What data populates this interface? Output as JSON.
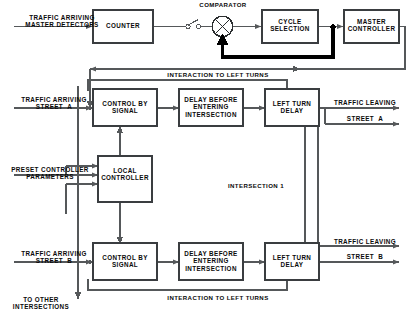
{
  "diagram": {
    "region_label": "INTERSECTION 1",
    "colors": {
      "line": "#55585a",
      "thick_line": "#000000",
      "box_border": "#3a3d40",
      "text": "#0a0a0a",
      "background": "#ffffff"
    },
    "blocks": [
      {
        "id": "counter",
        "label": "COUNTER"
      },
      {
        "id": "cycle-selection",
        "label": "CYCLE\nSELECTION"
      },
      {
        "id": "master-controller",
        "label": "MASTER\nCONTROLLER"
      },
      {
        "id": "control-by-signal-a",
        "label": "CONTROL BY\nSIGNAL"
      },
      {
        "id": "delay-before-entering-intersection-a",
        "label": "DELAY BEFORE\nENTERING\nINTERSECTION"
      },
      {
        "id": "left-turn-delay-a",
        "label": "LEFT TURN\nDELAY"
      },
      {
        "id": "local-controller",
        "label": "LOCAL\nCONTROLLER"
      },
      {
        "id": "control-by-signal-b",
        "label": "CONTROL BY\nSIGNAL"
      },
      {
        "id": "delay-before-entering-intersection-b",
        "label": "DELAY BEFORE\nENTERING\nINTERSECTION"
      },
      {
        "id": "left-turn-delay-b",
        "label": "LEFT TURN\nDELAY"
      }
    ],
    "nodes": [
      {
        "id": "comparator",
        "label": "COMPARATOR",
        "shape": "circle-with-x"
      },
      {
        "id": "switch",
        "label": "",
        "shape": "open-switch"
      }
    ],
    "signals": {
      "input_master_detectors": "TRAFFIC ARRIVING\nMASTER DETECTORS",
      "input_street_a": "TRAFFIC ARRIVING\nSTREET  A",
      "input_street_b": "TRAFFIC ARRIVING\nSTREET  B",
      "preset_parameters": "PRESET CONTROLLER\nPARAMETERS",
      "interaction_top": "INTERACTION TO LEFT TURNS",
      "interaction_bottom": "INTERACTION TO LEFT TURNS",
      "output_leaving_a_line1": "TRAFFIC LEAVING",
      "output_leaving_a_line2": "STREET  A",
      "output_leaving_b_line1": "TRAFFIC LEAVING",
      "output_leaving_b_line2": "STREET  B",
      "to_other_intersections": "TO OTHER\nINTERSECTIONS"
    }
  }
}
